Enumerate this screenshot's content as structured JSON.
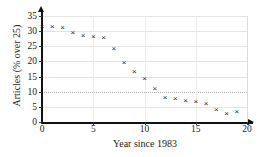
{
  "chart_data": {
    "type": "scatter",
    "title": "",
    "xlabel": "Year since 1983",
    "ylabel": "Articles (% over 25)",
    "xlim": [
      0,
      20
    ],
    "ylim": [
      0,
      35
    ],
    "xticks": [
      0,
      5,
      10,
      15,
      20
    ],
    "yticks": [
      0,
      5,
      10,
      15,
      20,
      25,
      30,
      35
    ],
    "grid": true,
    "legend": null,
    "marker": "x",
    "marker_color": "#2b2b2b",
    "x": [
      0,
      1,
      2,
      3,
      4,
      5,
      6,
      7,
      8,
      9,
      10,
      11,
      12,
      13,
      14,
      15,
      16,
      17,
      18,
      19
    ],
    "values": [
      31.5,
      31.5,
      31.0,
      29.3,
      28.3,
      28.2,
      27.8,
      24.2,
      19.4,
      16.5,
      14.2,
      11.0,
      8.0,
      7.6,
      7.0,
      6.7,
      5.8,
      4.0,
      2.8,
      3.3
    ]
  }
}
